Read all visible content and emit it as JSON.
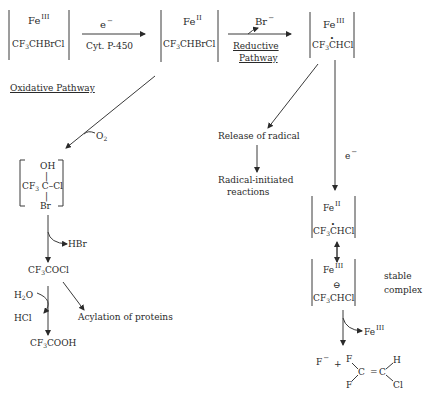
{
  "diagram": {
    "top_row": {
      "complex_1": {
        "metal": "Fe",
        "oxidation": "III",
        "substrate": "CF",
        "sub": "3",
        "rest": "CHBrCl"
      },
      "step_1": {
        "above": "e",
        "above_sup": "−",
        "below": "Cyt.  P-450"
      },
      "complex_2": {
        "metal": "Fe",
        "oxidation": "II",
        "substrate": "CF",
        "sub": "3",
        "rest": "CHBrCl"
      },
      "step_2": {
        "above": "Br",
        "above_sup": "−",
        "below_line1": "Reductive",
        "below_line2": "Pathway"
      },
      "complex_3": {
        "metal": "Fe",
        "oxidation": "III",
        "substrate": "CF",
        "sub": "3",
        "rest": "CHCl",
        "radical": true
      }
    },
    "oxidative": {
      "label": "Oxidative Pathway",
      "reagent": "O",
      "reagent_sub": "2",
      "intermediate": {
        "top": "OH",
        "left": "CF",
        "left_sub": "3",
        "center": "C",
        "right": "–Cl",
        "bottom": "Br"
      },
      "elimination": "HBr",
      "product_1": {
        "prefix": "CF",
        "sub": "3",
        "rest": "COCl"
      },
      "hydrolysis_in": {
        "prefix": "H",
        "sub": "2",
        "rest": "O"
      },
      "hydrolysis_out": "HCl",
      "side_product": "Acylation of proteins",
      "product_2": {
        "prefix": "CF",
        "sub": "3",
        "rest": "COOH"
      }
    },
    "radical_branch": {
      "release": "Release of radical",
      "reactions_line1": "Radical-initiated",
      "reactions_line2": "reactions"
    },
    "reductive_branch": {
      "electron": "e",
      "electron_sup": "−",
      "complex_4": {
        "metal": "Fe",
        "oxidation": "II",
        "substrate": "CF",
        "sub": "3",
        "rest": "CHCl",
        "radical": true
      },
      "complex_5": {
        "metal": "Fe",
        "oxidation": "III",
        "charge": "⊖",
        "substrate": "CF",
        "sub": "3",
        "rest": "CHCl"
      },
      "complex_note_line1": "stable",
      "complex_note_line2": "complex",
      "release": {
        "metal": "Fe",
        "oxidation": "III"
      },
      "products": {
        "fluoride": "F",
        "fluoride_sup": "−",
        "plus": "+",
        "f_top": "F",
        "f_bottom": "F",
        "c1": "C",
        "eq": "=",
        "c2": "C",
        "h": "H",
        "cl": "Cl"
      }
    }
  }
}
